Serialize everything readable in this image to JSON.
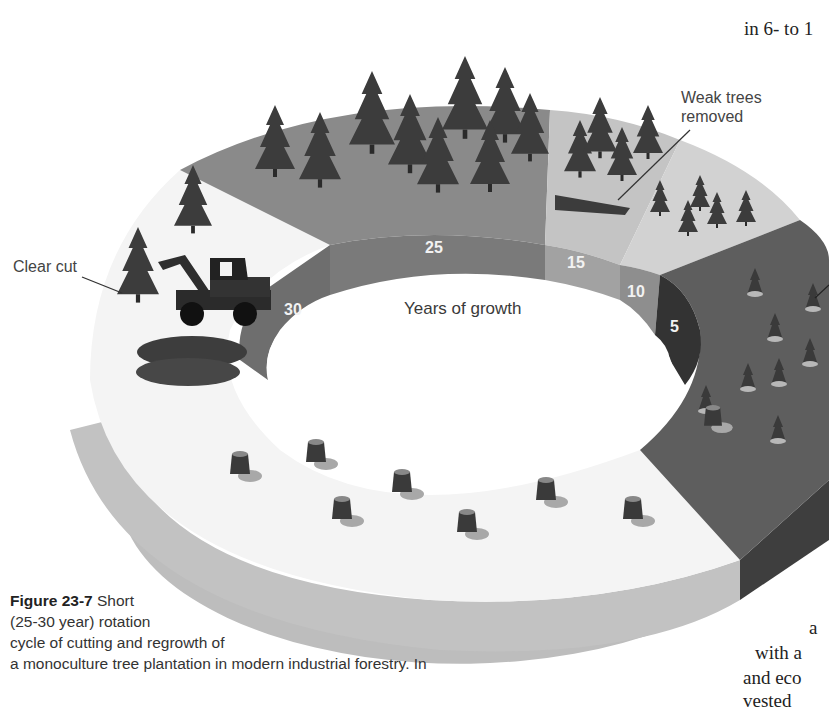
{
  "figure": {
    "number": "Figure 23-7",
    "caption_lines": [
      "Short",
      "(25-30 year) rotation",
      "cycle of cutting and regrowth of",
      "a monoculture tree plantation in modern industrial forestry. In"
    ],
    "center_label": "Years of growth",
    "callouts": {
      "clear_cut": "Clear cut",
      "weak_trees_line1": "Weak trees",
      "weak_trees_line2": "removed"
    },
    "ring_segments": [
      {
        "years": "30",
        "color": "#6e6e6e"
      },
      {
        "years": "25",
        "color": "#7a7a7a"
      },
      {
        "years": "15",
        "color": "#a2a2a2"
      },
      {
        "years": "10",
        "color": "#8e8e8e"
      },
      {
        "years": "5",
        "color": "#333333"
      }
    ],
    "colors": {
      "top_mature": "#8a8a8a",
      "top_thinning": "#c4c4c4",
      "top_young": "#d2d2d2",
      "top_seedling": "#5e5e5e",
      "top_clearcut": "#f2f2f2",
      "side_light": "#bdbdbd",
      "side_dark": "#3e3e3e",
      "tree": "#3c3c3c"
    }
  },
  "body_text": {
    "top_fragment": "in 6- to 1",
    "bottom_fragments": [
      "a",
      "with a",
      "and eco",
      "vested"
    ]
  }
}
